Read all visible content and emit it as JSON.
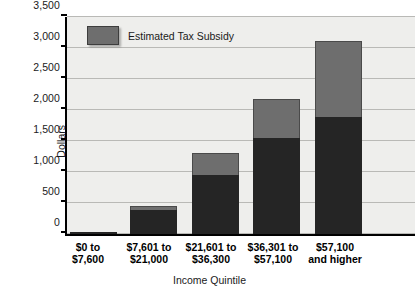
{
  "chart_data": {
    "type": "bar",
    "title": "",
    "xlabel": "Income Quintile",
    "ylabel": "Dollars",
    "ylim": [
      0,
      3500
    ],
    "ytick_step": 500,
    "yticks": [
      "0",
      "500",
      "1,000",
      "1,500",
      "2,000",
      "2,500",
      "3,000",
      "3,500"
    ],
    "grid": true,
    "stacked": true,
    "legend_position": "top-left",
    "categories": [
      [
        "$0 to",
        "$7,600"
      ],
      [
        "$7,601 to",
        "$21,000"
      ],
      [
        "$21,601 to",
        "$36,300"
      ],
      [
        "$36,301 to",
        "$57,100"
      ],
      [
        "$57,100",
        "and higher"
      ]
    ],
    "series": [
      {
        "name": "Base",
        "color": "#252525",
        "values": [
          25,
          390,
          950,
          1550,
          1880
        ]
      },
      {
        "name": "Estimated Tax Subsidy",
        "color": "#6e6e6e",
        "values": [
          0,
          60,
          350,
          630,
          1240
        ]
      }
    ],
    "totals": [
      25,
      450,
      1300,
      2180,
      3120
    ]
  },
  "legend": {
    "entries": [
      {
        "label": "Estimated Tax Subsidy",
        "color": "#6e6e6e"
      }
    ]
  },
  "colors": {
    "plot_background": "#eeeeec",
    "gridline": "#b9b9b6",
    "axis": "#000000",
    "base_segment": "#252525",
    "subsidy_segment": "#6e6e6e"
  }
}
